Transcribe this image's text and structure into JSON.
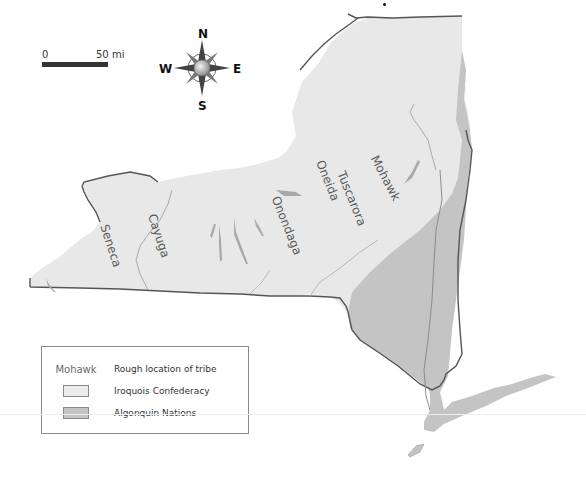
{
  "map": {
    "title": "",
    "region": "New York State",
    "colors": {
      "iroquois_fill": "#e8e8e8",
      "algonquin_fill": "#c4c4c4",
      "border": "#555555",
      "water": "#a9a9a9",
      "river": "#9a9a9a",
      "background": "#ffffff"
    },
    "tribes": [
      {
        "name": "Seneca",
        "x": 107,
        "y": 247,
        "rotate": 72
      },
      {
        "name": "Cayuga",
        "x": 155,
        "y": 237,
        "rotate": 72
      },
      {
        "name": "Onondaga",
        "x": 283,
        "y": 227,
        "rotate": 68
      },
      {
        "name": "Oneida",
        "x": 324,
        "y": 182,
        "rotate": 68
      },
      {
        "name": "Tuscarora",
        "x": 348,
        "y": 200,
        "rotate": 68
      },
      {
        "name": "Mohawk",
        "x": 382,
        "y": 180,
        "rotate": 62
      }
    ]
  },
  "scale_bar": {
    "start_label": "0",
    "end_label": "50 mi"
  },
  "compass": {
    "north": "N",
    "south": "S",
    "east": "E",
    "west": "W"
  },
  "legend": {
    "items": [
      {
        "key_type": "text",
        "key_text": "Mohawk",
        "label": "Rough location of tribe"
      },
      {
        "key_type": "swatch",
        "swatch_color": "#ececec",
        "label": "Iroquois Confederacy"
      },
      {
        "key_type": "swatch",
        "swatch_color": "#c4c4c4",
        "label": "Algonquin Nations"
      }
    ]
  }
}
